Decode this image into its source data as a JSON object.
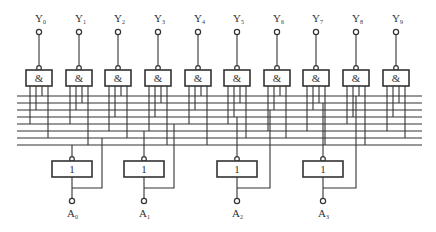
{
  "diagram": {
    "title": "",
    "bus": {
      "x1": 17,
      "x2": 422,
      "ys": [
        96,
        103,
        110,
        117,
        124,
        131,
        138,
        145
      ]
    },
    "and_gates": {
      "symbol": "&",
      "outputs": [
        {
          "label": "Y",
          "sub": "0",
          "x": 39,
          "taps": [
            4,
            2,
            0,
            6
          ]
        },
        {
          "label": "Y",
          "sub": "1",
          "x": 79,
          "taps": [
            4,
            2,
            1,
            7
          ]
        },
        {
          "label": "Y",
          "sub": "2",
          "x": 118,
          "taps": [
            5,
            3,
            0,
            6
          ]
        },
        {
          "label": "Y",
          "sub": "3",
          "x": 158,
          "taps": [
            5,
            3,
            1,
            7
          ]
        },
        {
          "label": "Y",
          "sub": "4",
          "x": 198,
          "taps": [
            4,
            2,
            0,
            7
          ]
        },
        {
          "label": "Y",
          "sub": "5",
          "x": 237,
          "taps": [
            4,
            3,
            1,
            6
          ]
        },
        {
          "label": "Y",
          "sub": "6",
          "x": 277,
          "taps": [
            5,
            2,
            0,
            6
          ]
        },
        {
          "label": "Y",
          "sub": "7",
          "x": 316,
          "taps": [
            5,
            2,
            1,
            7
          ]
        },
        {
          "label": "Y",
          "sub": "8",
          "x": 356,
          "taps": [
            4,
            3,
            0,
            7
          ]
        },
        {
          "label": "Y",
          "sub": "9",
          "x": 396,
          "taps": [
            5,
            3,
            1,
            6
          ]
        }
      ]
    },
    "not_gates": {
      "symbol": "1",
      "inputs": [
        {
          "label": "A",
          "sub": "0",
          "x": 72,
          "bus_true": 6,
          "bus_inv": 7,
          "loop_x": 102
        },
        {
          "label": "A",
          "sub": "1",
          "x": 144,
          "bus_true": 4,
          "bus_inv": 5,
          "loop_x": 174
        },
        {
          "label": "A",
          "sub": "2",
          "x": 237,
          "bus_true": 2,
          "bus_inv": 3,
          "loop_x": 270
        },
        {
          "label": "A",
          "sub": "3",
          "x": 323,
          "bus_true": 0,
          "bus_inv": 1,
          "loop_x": 356
        }
      ]
    }
  }
}
